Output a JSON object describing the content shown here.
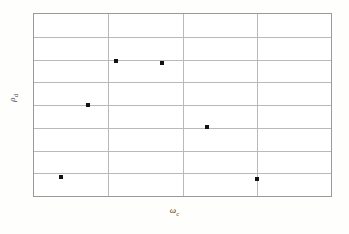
{
  "figure": {
    "background_color": "#fdfdfc",
    "frame_color": "#9a9a9a",
    "grid_color": "#b9b9b9",
    "marker_color": "#121212"
  },
  "axes": {
    "xlabel_symbol": "ω",
    "xlabel_subscript": "c",
    "ylabel_symbol": "ρ",
    "ylabel_subscript": "d"
  },
  "chart_data": {
    "type": "scatter",
    "title": "",
    "xlabel": "ωc",
    "ylabel": "ρd",
    "xlim": [
      0,
      4
    ],
    "ylim": [
      0,
      8
    ],
    "grid": true,
    "legend": null,
    "xticklabels": [],
    "yticklabels": [],
    "x_gridlines": [
      1,
      2,
      3
    ],
    "y_gridlines": [
      1,
      2,
      3,
      4,
      5,
      6,
      7
    ],
    "marker": "square",
    "marker_size_px": 4,
    "points": [
      {
        "x": 1.1,
        "y": 5.95
      },
      {
        "x": 1.72,
        "y": 5.85
      },
      {
        "x": 0.73,
        "y": 4.0
      },
      {
        "x": 2.33,
        "y": 3.05
      },
      {
        "x": 0.37,
        "y": 0.83
      },
      {
        "x": 3.0,
        "y": 0.74
      }
    ]
  }
}
